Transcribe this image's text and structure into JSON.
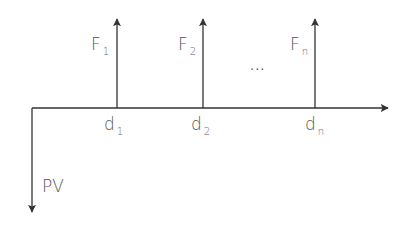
{
  "diagram": {
    "title": "",
    "type": "cash-flow timeline",
    "colors": {
      "line": "#333333",
      "text": "#555555",
      "background": "#ffffff"
    },
    "axis": {
      "x_start": 32,
      "x_end": 390,
      "y": 108
    },
    "present_value": {
      "label": "PV",
      "direction": "down"
    },
    "cash_flows": [
      {
        "label": "F",
        "sub": "1",
        "date_label": "d",
        "date_sub": "1",
        "direction": "up"
      },
      {
        "label": "F",
        "sub": "2",
        "date_label": "d",
        "date_sub": "2",
        "direction": "up"
      },
      {
        "label": "F",
        "sub": "n",
        "date_label": "d",
        "date_sub": "n",
        "direction": "up"
      }
    ],
    "ellipsis": "..."
  }
}
